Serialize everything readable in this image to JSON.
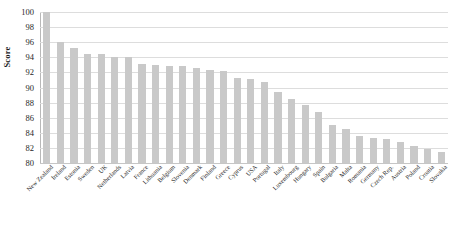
{
  "chart_data": {
    "type": "bar",
    "title": "",
    "subtitle": "",
    "xlabel": "",
    "ylabel": "Score",
    "ylim": [
      80,
      100
    ],
    "ytick_step": 2,
    "yticks": [
      80,
      82,
      84,
      86,
      88,
      90,
      92,
      94,
      96,
      98,
      100
    ],
    "grid": true,
    "legend": false,
    "legend_position": "none",
    "bar_color": "#c9c9c9",
    "categories": [
      "New Zealand",
      "Ireland",
      "Estonia",
      "Sweden",
      "UK",
      "Netherlands",
      "Latvia",
      "France",
      "Lithuania",
      "Belgium",
      "Slovenia",
      "Denmark",
      "Finland",
      "Greece",
      "Cyprus",
      "USA",
      "Portugal",
      "Italy",
      "Luxembourg",
      "Hungary",
      "Spain",
      "Bulgaria",
      "Malta",
      "Romania",
      "Germany",
      "Czech Rep.",
      "Austria",
      "Poland",
      "Croatia",
      "Slovakia"
    ],
    "values": [
      100.0,
      96.0,
      95.3,
      94.5,
      94.4,
      94.1,
      94.0,
      93.1,
      93.0,
      92.9,
      92.8,
      92.6,
      92.3,
      92.2,
      91.2,
      91.1,
      90.7,
      89.4,
      88.5,
      87.7,
      86.7,
      85.1,
      84.5,
      83.6,
      83.3,
      83.2,
      82.8,
      82.2,
      81.9,
      81.5
    ]
  },
  "axis": {
    "y_title": "Score"
  }
}
